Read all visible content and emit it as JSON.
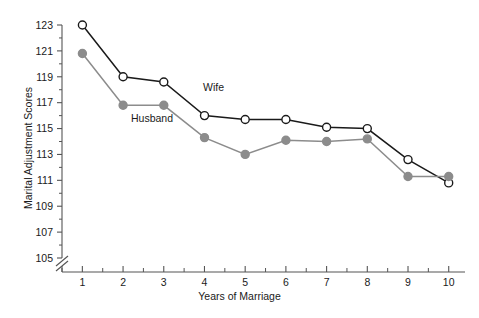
{
  "chart_data": {
    "type": "line",
    "title": "",
    "xlabel": "Years of Marriage",
    "ylabel": "Marital Adjustment Scores",
    "x": [
      1,
      2,
      3,
      4,
      5,
      6,
      7,
      8,
      9,
      10
    ],
    "categories": [
      "1",
      "2",
      "3",
      "4",
      "5",
      "6",
      "7",
      "8",
      "9",
      "10"
    ],
    "xlim": [
      0.5,
      10.4
    ],
    "ylim": [
      104.2,
      123.6
    ],
    "yticks": [
      105,
      107,
      109,
      111,
      113,
      115,
      117,
      119,
      121,
      123
    ],
    "ytick_labels": [
      "105",
      "107",
      "109",
      "111",
      "113",
      "115",
      "117",
      "119",
      "121",
      "123"
    ],
    "yminor_ticks": [
      106,
      108,
      110,
      112,
      114,
      116,
      118,
      120,
      122
    ],
    "xtick_labels": [
      "1",
      "2",
      "3",
      "4",
      "5",
      "6",
      "7",
      "8",
      "9",
      "10"
    ],
    "xminor_ticks": [
      0.5,
      1.5,
      2.5,
      3.5,
      4.5,
      5.5,
      6.5,
      7.5,
      8.5,
      9.5
    ],
    "grid": false,
    "legend_position": "inline-annotation",
    "axis_break": {
      "present": true,
      "axis": "y",
      "location": "below 105"
    },
    "series": [
      {
        "name": "Wife",
        "color": "#1a1a1a",
        "marker": "open-circle",
        "marker_fill": "#ffffff",
        "values": [
          123.0,
          119.0,
          118.6,
          116.0,
          115.7,
          115.7,
          115.1,
          115.0,
          112.6,
          110.8
        ]
      },
      {
        "name": "Husband",
        "color": "#8c8c8c",
        "marker": "filled-circle",
        "marker_fill": "#8c8c8c",
        "values": [
          120.8,
          116.8,
          116.8,
          114.3,
          113.0,
          114.1,
          114.0,
          114.2,
          111.3,
          111.3
        ]
      }
    ],
    "annotations": [
      {
        "text": "Wife",
        "x": 3.7,
        "y": 117.4
      },
      {
        "text": "Husband",
        "x": 2.1,
        "y": 115.4
      }
    ]
  },
  "colors": {
    "background": "#ffffff",
    "axis": "#555555",
    "text": "#1a1a1a",
    "wife": "#1a1a1a",
    "husband": "#8c8c8c"
  }
}
